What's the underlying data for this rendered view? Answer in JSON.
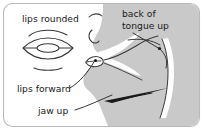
{
  "figure": {
    "name": "vocal-tract-articulation-diagram",
    "frame": {
      "border_color": "#b8b8b8",
      "background_color": "#ffffff",
      "corner_radius": 8
    },
    "colors": {
      "head_fill": "#c9c9c9",
      "cavity_fill": "#ffffff",
      "outline": "#3a3a3a",
      "label_text": "#1a1a1a",
      "leader_line": "#2b2b2b",
      "arrow": "#1a1a1a"
    }
  },
  "labels": {
    "lips_rounded": "lips rounded",
    "back_of_tongue": {
      "line1": "back of",
      "line2": "tongue up"
    },
    "lips_forward": "lips forward",
    "jaw_up": "jaw up"
  },
  "diagrams": {
    "lip_front_view": {
      "name": "rounded-lips-front-view",
      "description": "front view of rounded lips: upper arc, lens-shaped lips with inner oval aperture, lower arc"
    },
    "head_profile": {
      "name": "head-sagittal-profile",
      "description": "gray sagittal section of head with nose, lips, oral cavity, tongue and pharynx"
    }
  },
  "annotations": [
    {
      "id": "lips-rounded",
      "text": "lips rounded",
      "target": "front-view lip diagram"
    },
    {
      "id": "back-of-tongue-up",
      "text": "back of tongue up",
      "target": "tongue dorsum",
      "has_leader_dot": true
    },
    {
      "id": "lips-forward",
      "text": "lips forward",
      "target": "lips in profile",
      "has_leader_dot": true
    },
    {
      "id": "jaw-up",
      "text": "jaw up",
      "target": "jaw arrow",
      "has_arrow": true
    }
  ]
}
